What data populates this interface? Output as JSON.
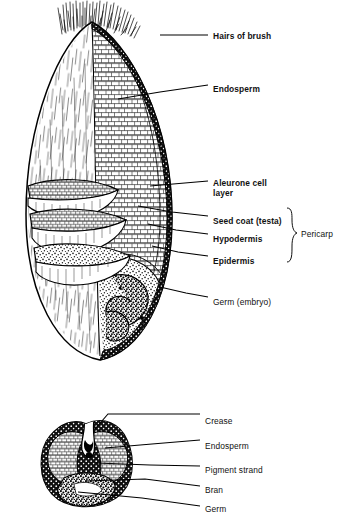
{
  "figure": {
    "title_visible": false,
    "ink_color": "#000000",
    "background_color": "#ffffff",
    "views": [
      {
        "name": "longitudinal-section",
        "caption": ""
      },
      {
        "name": "cross-section",
        "caption": ""
      }
    ]
  },
  "labels_top": [
    {
      "id": "hairs-of-brush",
      "text": "Hairs of brush",
      "x": 213,
      "y": 31,
      "weight": "bold"
    },
    {
      "id": "endosperm-top",
      "text": "Endosperm",
      "x": 213,
      "y": 84,
      "weight": "bold"
    },
    {
      "id": "aleurone-layer",
      "text": "Aleurone cell\nlayer",
      "x": 213,
      "y": 178,
      "weight": "bold"
    },
    {
      "id": "seed-coat",
      "text": "Seed coat (testa)",
      "x": 213,
      "y": 216,
      "weight": "bold"
    },
    {
      "id": "hypodermis",
      "text": "Hypodermis",
      "x": 213,
      "y": 234,
      "weight": "bold"
    },
    {
      "id": "epidermis",
      "text": "Epidermis",
      "x": 213,
      "y": 256,
      "weight": "bold"
    },
    {
      "id": "pericarp",
      "text": "Pericarp",
      "x": 301,
      "y": 233,
      "weight": "regular"
    },
    {
      "id": "germ-embryo",
      "text": "Germ (embryo)",
      "x": 213,
      "y": 297,
      "weight": "regular"
    }
  ],
  "labels_bottom": [
    {
      "id": "crease",
      "text": "Crease",
      "x": 205,
      "y": 421,
      "weight": "regular"
    },
    {
      "id": "endosperm-bot",
      "text": "Endosperm",
      "x": 205,
      "y": 445,
      "weight": "regular"
    },
    {
      "id": "pigment-strand",
      "text": "Pigment strand",
      "x": 205,
      "y": 469,
      "weight": "regular"
    },
    {
      "id": "bran",
      "text": "Bran",
      "x": 205,
      "y": 490,
      "weight": "regular"
    },
    {
      "id": "germ",
      "text": "Germ",
      "x": 205,
      "y": 509,
      "weight": "regular"
    }
  ],
  "leaders_top": [
    {
      "id": "leader-hairs-of-brush",
      "points": "160,35 208,35"
    },
    {
      "id": "leader-endosperm",
      "points": "118,99 160,92 208,85"
    },
    {
      "id": "leader-aleurone",
      "points": "150,186 208,181"
    },
    {
      "id": "leader-seed-coat",
      "points": "138,206 172,212 208,216"
    },
    {
      "id": "leader-hypodermis",
      "points": "148,224 176,230 208,234"
    },
    {
      "id": "leader-epidermis",
      "points": "152,246 178,252 208,256"
    },
    {
      "id": "leader-germ-embryo",
      "points": "160,287 186,293 208,297"
    }
  ],
  "leaders_bottom": [
    {
      "id": "leader-crease",
      "points": "95,429 108,414 200,414"
    },
    {
      "id": "leader-endosperm-bot",
      "points": "105,448 152,444 200,440"
    },
    {
      "id": "leader-pigment-strand",
      "points": "96,463 150,465 200,466"
    },
    {
      "id": "leader-bran",
      "points": "86,481 145,479 200,486"
    },
    {
      "id": "leader-germ",
      "points": "78,492 142,498 200,506"
    }
  ],
  "pericarp_brace": {
    "id": "pericarp-brace",
    "x": 287,
    "y_top": 208,
    "y_bottom": 262
  }
}
